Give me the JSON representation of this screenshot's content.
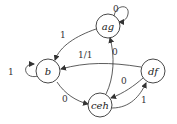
{
  "diagram": {
    "type": "state-machine",
    "nodes": [
      {
        "id": "ag",
        "label": "ag"
      },
      {
        "id": "b",
        "label": "b"
      },
      {
        "id": "df",
        "label": "df"
      },
      {
        "id": "ceh",
        "label": "ceh"
      }
    ],
    "edges": [
      {
        "from": "ag",
        "to": "ag",
        "label": "0"
      },
      {
        "from": "ag",
        "to": "b",
        "label": "1"
      },
      {
        "from": "b",
        "to": "b",
        "label": "1"
      },
      {
        "from": "df",
        "to": "b",
        "label": "1/1"
      },
      {
        "from": "b",
        "to": "ceh",
        "label": "0"
      },
      {
        "from": "ceh",
        "to": "ag",
        "label": "0"
      },
      {
        "from": "df",
        "to": "ceh",
        "label": "0"
      },
      {
        "from": "ceh",
        "to": "df",
        "label": "1"
      }
    ]
  }
}
